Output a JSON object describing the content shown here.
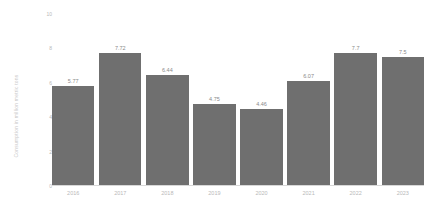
{
  "chart_data": {
    "type": "bar",
    "title": "",
    "subtitle": "",
    "xlabel": "",
    "ylabel": "Consumption in million metric tons",
    "categories": [
      "2016",
      "2017",
      "2018",
      "2019",
      "2020",
      "2021",
      "2022",
      "2023"
    ],
    "values": [
      5.77,
      7.72,
      6.44,
      4.75,
      4.46,
      6.07,
      7.7,
      7.5
    ],
    "value_labels": [
      "5.77",
      "7.72",
      "6.44",
      "4.75",
      "4.46",
      "6.07",
      "7.7",
      "7.5"
    ],
    "ylim": [
      0,
      10
    ],
    "y_ticks": [
      0,
      2,
      4,
      6,
      8,
      10
    ],
    "y_tick_labels": [
      "0",
      "2",
      "4",
      "6",
      "8",
      "10"
    ],
    "grid": false,
    "legend": null,
    "series": [
      {
        "name": "Consumption",
        "values": [
          5.77,
          7.72,
          6.44,
          4.75,
          4.46,
          6.07,
          7.7,
          7.5
        ]
      }
    ],
    "colors": {
      "bar": "#6f6f6f",
      "axis": "#d8d8d8",
      "value_label": "#8a8a8a",
      "tick_label": "#b9b9b9",
      "axis_title": "#c9c9c9",
      "background": "#ffffff"
    }
  }
}
